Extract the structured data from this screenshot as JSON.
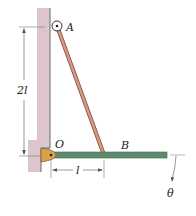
{
  "figure": {
    "labels": {
      "A": "A",
      "B": "B",
      "O": "O",
      "height": "2l",
      "length": "l",
      "angle": "θ"
    },
    "colors": {
      "wall": "#d9c2c8",
      "wall_edge": "#6b6b6b",
      "rod_AB": "#c98a78",
      "rod_AB_edge": "#8a4a3a",
      "bar_OB": "#5f8a6e",
      "pivot": "#d9a24a",
      "dimension": "#555555"
    }
  }
}
